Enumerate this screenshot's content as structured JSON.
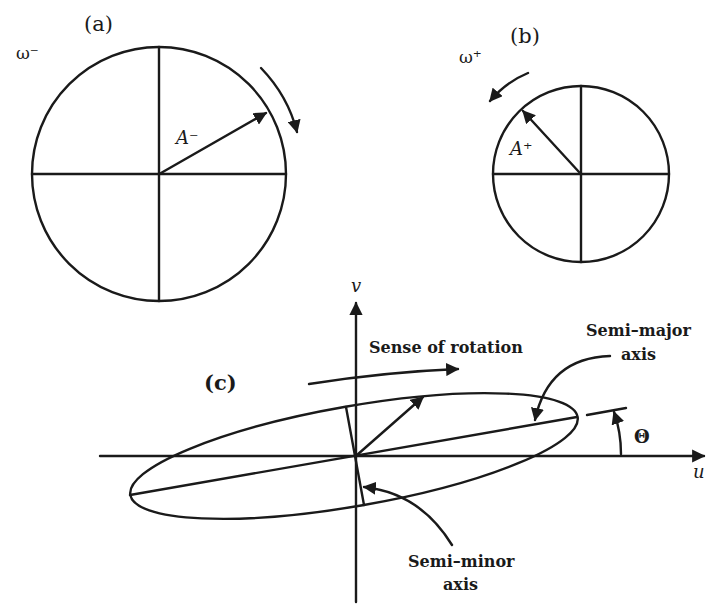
{
  "figure": {
    "panel_a": {
      "label": "(a)",
      "omega_label": "ω⁻",
      "vector_label": "A⁻",
      "rotation": "clockwise"
    },
    "panel_b": {
      "label": "(b)",
      "omega_label": "ω⁺",
      "vector_label": "A⁺",
      "rotation": "counterclockwise"
    },
    "panel_c": {
      "label": "(c)",
      "v_axis_label": "v",
      "u_axis_label": "u",
      "rotation_label": "Sense of rotation",
      "semi_major_label_line1": "Semi–major",
      "semi_major_label_line2": "axis",
      "semi_minor_label_line1": "Semi–minor",
      "semi_minor_label_line2": "axis",
      "angle_label": "Θ"
    }
  }
}
